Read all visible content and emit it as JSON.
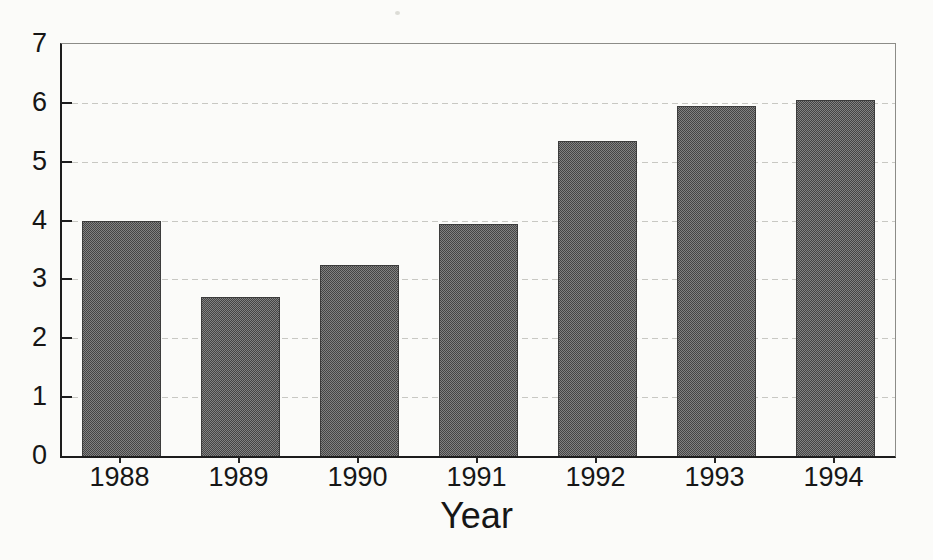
{
  "chart_data": {
    "type": "bar",
    "title": "",
    "xlabel": "Year",
    "ylabel": "",
    "categories": [
      "1988",
      "1989",
      "1990",
      "1991",
      "1992",
      "1993",
      "1994"
    ],
    "values": [
      4.0,
      2.7,
      3.25,
      3.95,
      5.35,
      5.95,
      6.05
    ],
    "ylim": [
      0,
      7
    ],
    "yticks": [
      0,
      1,
      2,
      3,
      4,
      5,
      6,
      7
    ],
    "grid": "horizontal dotted gridlines at each integer value",
    "legend": "none",
    "bar_style": "dark gray halftone fill (scanned print)"
  },
  "colors": {
    "paper": "#fbfbf9",
    "bar_halftone_dark": "#454545",
    "bar_halftone_light": "#828282",
    "bar_outline": "#3c3c3c",
    "axis": "#1d1d1d",
    "frame": "#8c8c88",
    "gridline": "#c8c8c3",
    "text": "#161616"
  }
}
